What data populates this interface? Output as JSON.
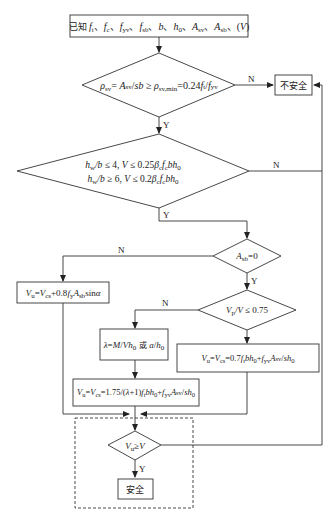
{
  "diagram": {
    "type": "flowchart",
    "nodes": {
      "start": {
        "shape": "rectangle",
        "label": "已知 f_t、f_c、f_yv、f_sb、b、h_0、A_sv、A_sb、(V)"
      },
      "check_rho": {
        "shape": "diamond",
        "label": "ρ_sv = A_sv/(sb) ≥ ρ_sv,min = 0.24 f_t/f_yv"
      },
      "unsafe": {
        "shape": "rectangle",
        "label": "不安全"
      },
      "check_section": {
        "shape": "diamond",
        "line1": "h_w/b ≤ 4, V ≤ 0.25β_c f_c b h_0",
        "line2": "h_w/b ≥ 6, V ≤ 0.2β_c f_c b h_0"
      },
      "check_asb": {
        "shape": "diamond",
        "label": "A_sb=0"
      },
      "bent_bar": {
        "shape": "rectangle",
        "label": "V_u = V_cs + 0.8 f_y A_sb sinα"
      },
      "check_vp": {
        "shape": "diamond",
        "label": "V_p/V ≤ 0.75"
      },
      "lambda": {
        "shape": "rectangle",
        "label": "λ = M/(V h_0) 或 a/h_0"
      },
      "vu_general": {
        "shape": "rectangle",
        "label": "V_u = V_cs = 0.7 f_t b h_0 + f_yv (A_sv/s) h_0"
      },
      "vu_concentrated": {
        "shape": "rectangle",
        "label": "V_u = V_cs = 1.75/(λ+1) f_t b h_0 + f_yv (A_sv/s) h_0"
      },
      "check_final": {
        "shape": "diamond",
        "label": "V_u ≥ V"
      },
      "safe": {
        "shape": "rectangle",
        "label": "安全"
      }
    },
    "edges": [
      {
        "from": "start",
        "to": "check_rho",
        "label": ""
      },
      {
        "from": "check_rho",
        "to": "unsafe",
        "label": "N"
      },
      {
        "from": "check_rho",
        "to": "check_section",
        "label": "Y"
      },
      {
        "from": "check_section",
        "to": "unsafe",
        "label": "N"
      },
      {
        "from": "check_section",
        "to": "check_asb",
        "label": "Y"
      },
      {
        "from": "check_asb",
        "to": "bent_bar",
        "label": "N"
      },
      {
        "from": "check_asb",
        "to": "check_vp",
        "label": "Y"
      },
      {
        "from": "check_vp",
        "to": "lambda",
        "label": "N"
      },
      {
        "from": "check_vp",
        "to": "vu_general",
        "label": "Y"
      },
      {
        "from": "lambda",
        "to": "vu_concentrated",
        "label": ""
      },
      {
        "from": "bent_bar",
        "to": "check_final",
        "label": ""
      },
      {
        "from": "vu_concentrated",
        "to": "check_final",
        "label": ""
      },
      {
        "from": "vu_general",
        "to": "check_final",
        "label": ""
      },
      {
        "from": "check_final",
        "to": "safe",
        "label": "Y"
      },
      {
        "from": "check_final",
        "to": "unsafe",
        "label": "N"
      }
    ],
    "labels": {
      "yes": "Y",
      "no": "N",
      "unsafe": "不安全",
      "safe": "安全",
      "known": "已知",
      "or": "或"
    }
  }
}
